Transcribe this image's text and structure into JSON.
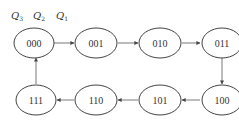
{
  "header": {
    "bit_labels": [
      {
        "letter": "Q",
        "sub": "3"
      },
      {
        "letter": "Q",
        "sub": "2"
      },
      {
        "letter": "Q",
        "sub": "1"
      }
    ]
  },
  "states": [
    "000",
    "001",
    "010",
    "011",
    "100",
    "101",
    "110",
    "111"
  ],
  "transitions": [
    [
      "000",
      "001"
    ],
    [
      "001",
      "010"
    ],
    [
      "010",
      "011"
    ],
    [
      "011",
      "100"
    ],
    [
      "100",
      "101"
    ],
    [
      "101",
      "110"
    ],
    [
      "110",
      "111"
    ],
    [
      "111",
      "000"
    ]
  ],
  "colors": {
    "stroke": "#444444",
    "text": "#333333",
    "background": "#ffffff"
  }
}
